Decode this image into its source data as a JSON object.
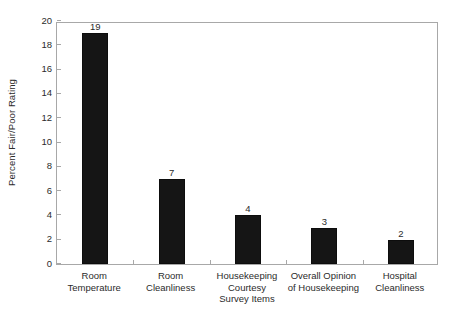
{
  "chart_data": {
    "type": "bar",
    "title": "",
    "xlabel": "",
    "ylabel": "Percent Fair/Poor Rating",
    "categories": [
      "Room Temperature",
      "Room Cleanliness",
      "Housekeeping Courtesy Survey Items",
      "Overall Opinion of Housekeeping",
      "Hospital Cleanliness"
    ],
    "category_lines": [
      [
        "Room",
        "Temperature"
      ],
      [
        "Room",
        "Cleanliness"
      ],
      [
        "Housekeeping",
        "Courtesy",
        "Survey Items"
      ],
      [
        "Overall Opinion",
        "of Housekeeping"
      ],
      [
        "Hospital",
        "Cleanliness"
      ]
    ],
    "values": [
      19,
      7,
      4,
      3,
      2
    ],
    "value_labels": [
      "19",
      "7",
      "4",
      "3",
      "2"
    ],
    "ylim": [
      0,
      20
    ],
    "yticks": [
      0,
      2,
      4,
      6,
      8,
      10,
      12,
      14,
      16,
      18,
      20
    ],
    "ytick_labels": [
      "0",
      "2",
      "4",
      "6",
      "8",
      "10",
      "12",
      "14",
      "16",
      "18",
      "20"
    ],
    "grid": false,
    "legend": null,
    "colors": {
      "bar": "#151515",
      "axis": "#a8a8a8",
      "text": "#2b2b2b",
      "background": "#ffffff"
    }
  }
}
